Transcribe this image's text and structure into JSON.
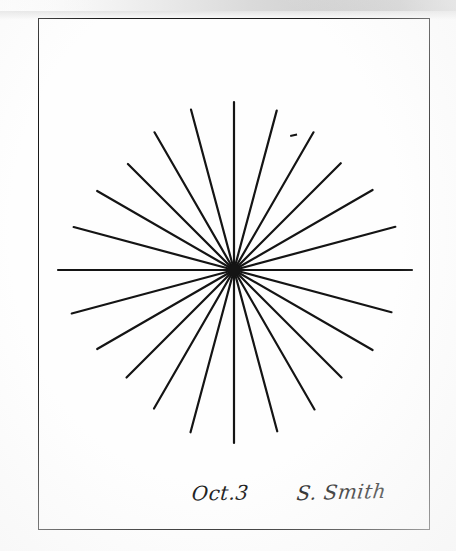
{
  "page": {
    "width": 456,
    "height": 551,
    "background_color": "#fefefe",
    "ink_color": "#1a1a1a",
    "document_type": "hand-drawn figure on paper (scanned)"
  },
  "scan_artifact": {
    "name": "gray-band-top",
    "description": "horizontal gray gradient band along the top edge of the scan",
    "color_left": "#ffffff",
    "color_right": "#c9c9c9",
    "height_px": 11
  },
  "figure_border": {
    "name": "rectangular-frame",
    "left": 38,
    "top": 18,
    "width": 392,
    "height": 512,
    "stroke_color": "#1a1a1a",
    "stroke_width": 1.6
  },
  "chart_data": {
    "type": "scatter",
    "title": "",
    "subtitle": "",
    "xlabel": "",
    "ylabel": "",
    "grid": false,
    "legend": null,
    "center": {
      "x": 234,
      "y": 270
    },
    "ray_count": 24,
    "angle_step_degrees": 15,
    "stroke_color": "#141414",
    "stroke_width": 2.2,
    "rays": [
      {
        "index": 0,
        "angle_deg": 0,
        "length": 178,
        "label": "east"
      },
      {
        "index": 1,
        "angle_deg": 15,
        "length": 163,
        "label": ""
      },
      {
        "index": 2,
        "angle_deg": 30,
        "length": 160,
        "label": ""
      },
      {
        "index": 3,
        "angle_deg": 45,
        "length": 152,
        "label": ""
      },
      {
        "index": 4,
        "angle_deg": 60,
        "length": 161,
        "label": ""
      },
      {
        "index": 5,
        "angle_deg": 75,
        "length": 167,
        "label": ""
      },
      {
        "index": 6,
        "angle_deg": 90,
        "length": 173,
        "label": "south"
      },
      {
        "index": 7,
        "angle_deg": 105,
        "length": 168,
        "label": ""
      },
      {
        "index": 8,
        "angle_deg": 120,
        "length": 160,
        "label": ""
      },
      {
        "index": 9,
        "angle_deg": 135,
        "length": 152,
        "label": ""
      },
      {
        "index": 10,
        "angle_deg": 150,
        "length": 158,
        "label": ""
      },
      {
        "index": 11,
        "angle_deg": 165,
        "length": 168,
        "label": ""
      },
      {
        "index": 12,
        "angle_deg": 180,
        "length": 176,
        "label": "west"
      },
      {
        "index": 13,
        "angle_deg": 195,
        "length": 166,
        "label": ""
      },
      {
        "index": 14,
        "angle_deg": 210,
        "length": 158,
        "label": ""
      },
      {
        "index": 15,
        "angle_deg": 225,
        "length": 150,
        "label": ""
      },
      {
        "index": 16,
        "angle_deg": 240,
        "length": 159,
        "label": ""
      },
      {
        "index": 17,
        "angle_deg": 255,
        "length": 166,
        "label": ""
      },
      {
        "index": 18,
        "angle_deg": 270,
        "length": 168,
        "label": "north"
      },
      {
        "index": 19,
        "angle_deg": 285,
        "length": 165,
        "label": ""
      },
      {
        "index": 20,
        "angle_deg": 300,
        "length": 159,
        "label": ""
      },
      {
        "index": 21,
        "angle_deg": 315,
        "length": 151,
        "label": ""
      },
      {
        "index": 22,
        "angle_deg": 330,
        "length": 160,
        "label": ""
      },
      {
        "index": 23,
        "angle_deg": 345,
        "length": 167,
        "label": ""
      }
    ],
    "stray_marks": [
      {
        "name": "ink-speck",
        "x": 290,
        "y": 135,
        "width": 7,
        "height": 2
      }
    ]
  },
  "annotations": {
    "date": {
      "text": "Oct.3",
      "style": "cursive handwriting",
      "x": 192,
      "y": 481
    },
    "signature": {
      "text": "S. Smith",
      "style": "cursive handwriting",
      "x": 297,
      "y": 480
    }
  }
}
